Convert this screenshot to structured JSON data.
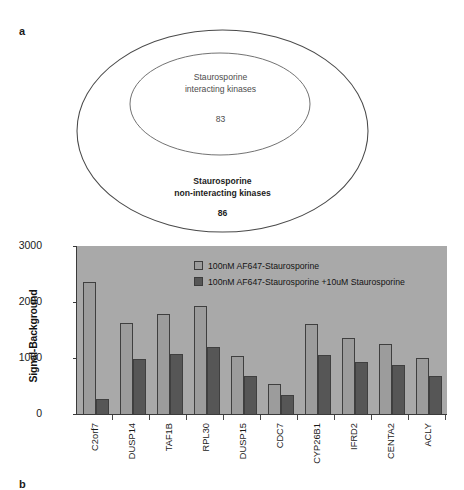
{
  "figure": {
    "panel_a_label": "a",
    "panel_b_label": "b"
  },
  "panel_a": {
    "type": "nested-ellipse-venn",
    "inner_set": {
      "caption_line1": "Staurosporine",
      "caption_line2": "interacting kinases",
      "count": "83"
    },
    "outer_set": {
      "caption_line1": "Staurosporine",
      "caption_line2": "non-interacting kinases",
      "count": "86"
    }
  },
  "chart_data": {
    "type": "bar",
    "title": "",
    "xlabel": "",
    "ylabel": "Signal-Background",
    "ylim": [
      0,
      3000
    ],
    "yticks": [
      0,
      1000,
      2000,
      3000
    ],
    "ytick_labels": [
      "0",
      "1000",
      "2000",
      "3000"
    ],
    "grid": false,
    "legend_position": "top-center-inside",
    "plot_background": "#a9a9a9",
    "categories": [
      "C2orf7",
      "DUSP14",
      "TAF1B",
      "RPL30",
      "DUSP15",
      "CDC7",
      "CYP26B1",
      "IFRD2",
      "CENTA2",
      "ACLY"
    ],
    "series": [
      {
        "name": "100nM AF647-Staurosporine",
        "color": "#9c9c9c",
        "values": [
          2350,
          1630,
          1790,
          1930,
          1030,
          540,
          1600,
          1350,
          1250,
          1000
        ]
      },
      {
        "name": "100nM AF647-Staurosporine +10uM Staurosporine",
        "color": "#565656",
        "values": [
          270,
          975,
          1065,
          1200,
          675,
          345,
          1060,
          925,
          875,
          675
        ]
      }
    ]
  }
}
